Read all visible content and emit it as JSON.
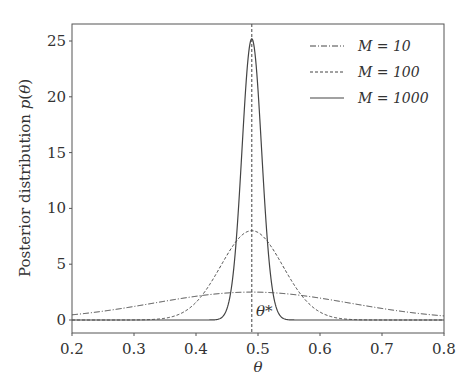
{
  "chart_data": {
    "type": "line",
    "title": "",
    "xlabel": "θ",
    "ylabel": "Posterior distribution p(θ)",
    "xlim": [
      0.2,
      0.8
    ],
    "ylim": [
      -1.2,
      26.5
    ],
    "xticks": [
      "0.2",
      "0.3",
      "0.4",
      "0.5",
      "0.6",
      "0.7",
      "0.8"
    ],
    "yticks": [
      "0",
      "5",
      "10",
      "15",
      "20",
      "25"
    ],
    "grid": false,
    "legend_position": "upper right",
    "annotations": [
      {
        "text": "θ*",
        "x": 0.49,
        "type": "vertical dashed line at true value"
      }
    ],
    "theta_star": 0.49,
    "series": [
      {
        "name": "M = 10",
        "style": "dash-dot",
        "peak_x": 0.49,
        "peak_y": 2.5,
        "sigma": 0.158
      },
      {
        "name": "M = 100",
        "style": "dashed",
        "peak_x": 0.49,
        "peak_y": 8.0,
        "sigma": 0.05
      },
      {
        "name": "M = 1000",
        "style": "solid",
        "peak_x": 0.49,
        "peak_y": 25.2,
        "sigma": 0.0158
      }
    ]
  },
  "legend": {
    "items": [
      {
        "label": "M = 10"
      },
      {
        "label": "M = 100"
      },
      {
        "label": "M = 1000"
      }
    ]
  },
  "axes": {
    "xlabel": "θ",
    "ylabel": "Posterior distribution p(θ)",
    "annotation": "θ*"
  }
}
